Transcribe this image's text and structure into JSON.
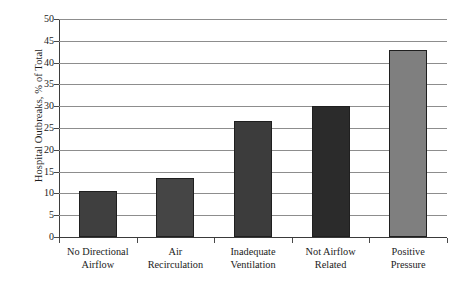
{
  "chart_data": {
    "type": "bar",
    "title": "",
    "xlabel": "",
    "ylabel": "Hospital Outbreaks, % of Total",
    "ylim": [
      0,
      50
    ],
    "ytick_step": 5,
    "yticks": [
      "0",
      "5",
      "10",
      "15",
      "20",
      "25",
      "30",
      "35",
      "40",
      "45",
      "50"
    ],
    "grid": true,
    "legend": "none",
    "categories": [
      "No Directional Airflow",
      "Air Recirculation",
      "Inadequate Ventilation",
      "Not Airflow Related",
      "Positive Pressure"
    ],
    "category_lines": [
      {
        "line1": "No Directional",
        "line2": "Airflow"
      },
      {
        "line1": "Air",
        "line2": "Recirculation"
      },
      {
        "line1": "Inadequate",
        "line2": "Ventilation"
      },
      {
        "line1": "Not Airflow",
        "line2": "Related"
      },
      {
        "line1": "Positive",
        "line2": "Pressure"
      }
    ],
    "values": [
      10.5,
      13.5,
      26.5,
      30,
      43
    ],
    "bar_colors": [
      "#3f3f3f",
      "#454545",
      "#3c3c3c",
      "#2b2b2b",
      "#7f7f7f"
    ],
    "bar_edge_color": "#1f1f1f",
    "gridline_color": "#8d8d8d",
    "axis_color": "#3d3d3d",
    "background": "#ffffff"
  }
}
